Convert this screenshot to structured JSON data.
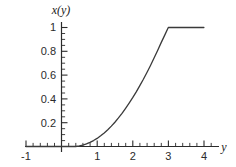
{
  "chart_data": {
    "type": "line",
    "title": "",
    "subtitle": "",
    "xlabel": "y",
    "ylabel": "x(y)",
    "xlim": [
      -1,
      4
    ],
    "ylim": [
      0,
      1.08
    ],
    "grid": false,
    "legend": false,
    "legend_position": "none",
    "x_ticks": [
      -1,
      0,
      1,
      2,
      3,
      4
    ],
    "x_tick_labels": [
      "-1",
      "",
      "1",
      "2",
      "3",
      "4"
    ],
    "x_minor_step": 0.2,
    "y_ticks": [
      0.2,
      0.4,
      0.6,
      0.8,
      1
    ],
    "y_tick_labels": [
      "0.2",
      "0.4",
      "0.6",
      "0.8",
      "1"
    ],
    "y_minor_step": 0.05,
    "line_color": "#3a3a3a",
    "axis_color": "#2b2b2b",
    "background_color": "#ffffff",
    "series": [
      {
        "name": "x(y)",
        "x": [
          -1.0,
          -0.8,
          -0.6,
          -0.4,
          -0.2,
          0.0,
          0.2,
          0.4,
          0.5,
          0.6,
          0.7,
          0.8,
          0.9,
          1.0,
          1.1,
          1.2,
          1.3,
          1.4,
          1.5,
          1.6,
          1.7,
          1.8,
          1.9,
          2.0,
          2.1,
          2.2,
          2.3,
          2.4,
          2.5,
          2.6,
          2.7,
          2.8,
          2.9,
          3.0,
          3.2,
          3.4,
          3.6,
          3.8,
          4.0
        ],
        "y": [
          0.0,
          0.0,
          0.0,
          0.0,
          0.0,
          0.0,
          0.0,
          0.0,
          0.005,
          0.012,
          0.022,
          0.035,
          0.05,
          0.068,
          0.09,
          0.114,
          0.141,
          0.171,
          0.204,
          0.24,
          0.278,
          0.32,
          0.364,
          0.41,
          0.459,
          0.511,
          0.565,
          0.622,
          0.681,
          0.743,
          0.807,
          0.873,
          0.936,
          1.0,
          1.0,
          1.0,
          1.0,
          1.0,
          1.0
        ]
      }
    ],
    "annotations": [
      {
        "text": "curve saturates at x(y) = 1 for y >= 3"
      }
    ]
  },
  "axes": {
    "y_axis_label": "x(y)",
    "x_axis_label": "y"
  }
}
